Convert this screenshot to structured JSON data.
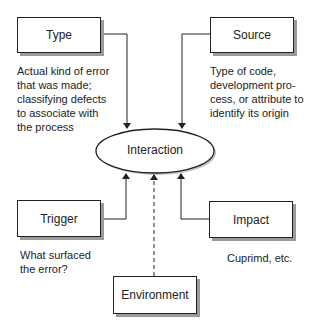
{
  "diagram": {
    "center": {
      "label": "Interaction"
    },
    "nodes": [
      {
        "id": "type",
        "label": "Type",
        "description": "Actual kind of error that was made; classifying defects to associate with the process",
        "description_lines": [
          "Actual kind of error",
          "that was made;",
          "classifying defects",
          "to associate with",
          "the process"
        ]
      },
      {
        "id": "source",
        "label": "Source",
        "description": "Type of code, development process, or attribute to identify its origin",
        "description_lines": [
          "Type of code,",
          "development pro-",
          "cess, or attribute to",
          "identify its origin"
        ]
      },
      {
        "id": "trigger",
        "label": "Trigger",
        "description": "What surfaced the error?",
        "description_lines": [
          "What surfaced",
          "the error?"
        ]
      },
      {
        "id": "impact",
        "label": "Impact",
        "description": "Cuprimd, etc.",
        "description_lines": [
          "Cuprimd, etc."
        ]
      },
      {
        "id": "environment",
        "label": "Environment",
        "description": "",
        "description_lines": []
      }
    ],
    "edges": [
      {
        "from": "type",
        "to": "interaction",
        "style": "solid"
      },
      {
        "from": "source",
        "to": "interaction",
        "style": "solid"
      },
      {
        "from": "trigger",
        "to": "interaction",
        "style": "solid"
      },
      {
        "from": "impact",
        "to": "interaction",
        "style": "solid"
      },
      {
        "from": "environment",
        "to": "interaction",
        "style": "dashed"
      }
    ]
  }
}
